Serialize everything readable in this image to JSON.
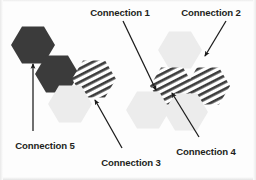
{
  "diagram": {
    "background_color": "#fdfdfd",
    "text_color": "#231f20",
    "colors": {
      "dark_hex": "#3b3b3b",
      "light_hex": "#ececec",
      "stripe_line": "#404040",
      "stripe_bg": "#ffffff",
      "arrow": "#1b1b1b"
    },
    "labels": [
      {
        "id": "connection-1",
        "text": "Connection 1",
        "x": 120,
        "y": 8,
        "anchor": "middle"
      },
      {
        "id": "connection-2",
        "text": "Connection 2",
        "x": 211,
        "y": 8,
        "anchor": "middle"
      },
      {
        "id": "connection-3",
        "text": "Connection 3",
        "x": 131,
        "y": 158,
        "anchor": "middle"
      },
      {
        "id": "connection-4",
        "text": "Connection 4",
        "x": 206,
        "y": 147,
        "anchor": "middle"
      },
      {
        "id": "connection-5",
        "text": "Connection 5",
        "x": 45,
        "y": 141,
        "anchor": "middle"
      }
    ],
    "hexagons": [
      {
        "id": "hex-dark-top-left",
        "cx": 33,
        "cy": 45,
        "r": 22,
        "fill": "dark"
      },
      {
        "id": "hex-dark-mid-left",
        "cx": 57,
        "cy": 74,
        "r": 22,
        "fill": "dark"
      },
      {
        "id": "hex-striped-left",
        "cx": 94,
        "cy": 79,
        "r": 22,
        "fill": "striped"
      },
      {
        "id": "hex-light-left",
        "cx": 70,
        "cy": 104,
        "r": 22,
        "fill": "light"
      },
      {
        "id": "hex-light-top-right",
        "cx": 180,
        "cy": 50,
        "r": 22,
        "fill": "light"
      },
      {
        "id": "hex-striped-right-a",
        "cx": 172,
        "cy": 86,
        "r": 22,
        "fill": "striped"
      },
      {
        "id": "hex-striped-right-b",
        "cx": 208,
        "cy": 86,
        "r": 22,
        "fill": "striped"
      },
      {
        "id": "hex-light-bottom-left",
        "cx": 148,
        "cy": 110,
        "r": 22,
        "fill": "light"
      },
      {
        "id": "hex-light-bottom-right",
        "cx": 186,
        "cy": 112,
        "r": 22,
        "fill": "light"
      }
    ],
    "arrows": [
      {
        "id": "arrow-connection-1",
        "x1": 123,
        "y1": 21,
        "x2": 156,
        "y2": 90
      },
      {
        "id": "arrow-connection-2",
        "x1": 226,
        "y1": 21,
        "x2": 205,
        "y2": 56
      },
      {
        "id": "arrow-connection-3",
        "x1": 122,
        "y1": 148,
        "x2": 95,
        "y2": 100
      },
      {
        "id": "arrow-connection-4",
        "x1": 199,
        "y1": 137,
        "x2": 172,
        "y2": 93
      },
      {
        "id": "arrow-connection-5",
        "x1": 33,
        "y1": 131,
        "x2": 33,
        "y2": 64
      }
    ]
  }
}
